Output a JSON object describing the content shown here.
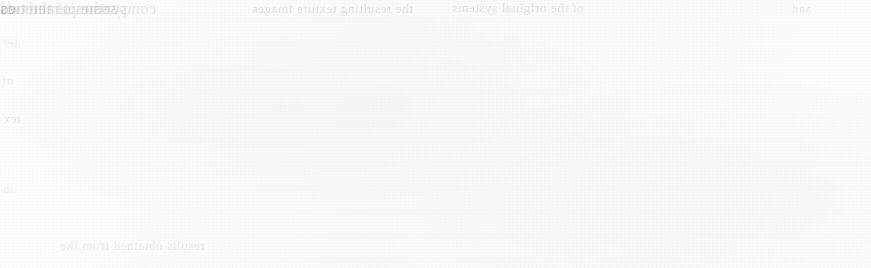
{
  "document": {
    "kind": "scanned-print-page",
    "page_background_color": "#fbfbf9",
    "ink_color": "#3a3a38"
  },
  "figure": {
    "caption": "",
    "panels": [
      {
        "id": "left",
        "name": "left-texture-image",
        "label": "",
        "texture": "vertical-streaked halftone noise",
        "mean_tone": "#6b6b69",
        "x": 38,
        "y": 14,
        "width": 382,
        "height": 208,
        "has_left_dark_band": true
      },
      {
        "id": "right",
        "name": "right-texture-image",
        "label": "",
        "texture": "horizontal wavy blob halftone noise",
        "mean_tone": "#727270",
        "x": 455,
        "y": 22,
        "width": 385,
        "height": 196,
        "has_left_dark_band": false
      }
    ]
  },
  "bleed_through_text": {
    "note": "faint mirrored text showing through from the reverse side of the sheet",
    "fragments": [
      {
        "id": "top-mid",
        "text": "the resulting texture images"
      },
      {
        "id": "top-right",
        "text": "of the original systems"
      },
      {
        "id": "far-right",
        "text": "and"
      },
      {
        "id": "left-1",
        "text": "ter"
      },
      {
        "id": "left-2",
        "text": "of"
      },
      {
        "id": "left-3",
        "text": "tex"
      },
      {
        "id": "left-4",
        "text": "an"
      },
      {
        "id": "bot-1",
        "text": "results obtained from the"
      },
      {
        "id": "bot-2",
        "text": "same parameters"
      },
      {
        "id": "bot-3",
        "text": "comparison of the two"
      },
      {
        "id": "bot-4",
        "text": "synthesis methods"
      },
      {
        "id": "right-1",
        "text": "us"
      },
      {
        "id": "right-2",
        "text": "ed"
      }
    ]
  }
}
